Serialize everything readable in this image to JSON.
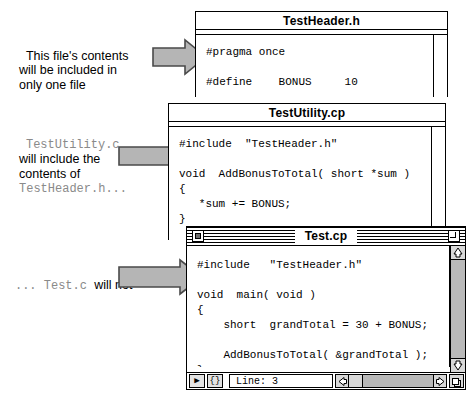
{
  "annotations": [
    {
      "id": "annot-1",
      "segments": [
        {
          "text": "This file's contents\nwill be included in\nonly one file",
          "style": "plain"
        }
      ],
      "arrow_name": "arrow-to-testheader"
    },
    {
      "id": "annot-2",
      "segments": [
        {
          "text": "TestUtility.c",
          "style": "mono"
        },
        {
          "text": "\nwill include the\ncontents of\n",
          "style": "plain"
        },
        {
          "text": "TestHeader.h...",
          "style": "mono"
        }
      ],
      "arrow_name": "arrow-to-testutility"
    },
    {
      "id": "annot-3",
      "segments": [
        {
          "text": "... Test.c ",
          "style": "mono"
        },
        {
          "text": "will not",
          "style": "plain"
        }
      ],
      "arrow_name": "arrow-to-test"
    }
  ],
  "windows": {
    "header": {
      "title": "TestHeader.h",
      "active": false,
      "code": "#pragma once\n\n#define    BONUS     10"
    },
    "utility": {
      "title": "TestUtility.cp",
      "active": false,
      "code": "#include  \"TestHeader.h\"\n\nvoid  AddBonusToTotal( short *sum )\n{\n   *sum += BONUS;\n}"
    },
    "test": {
      "title": "Test.cp",
      "active": true,
      "code": "#include   \"TestHeader.h\"\n\nvoid  main( void )\n{\n    short  grandTotal = 30 + BONUS;\n\n    AddBonusToTotal( &grandTotal );\n}",
      "status": {
        "popup_label": "▶",
        "braces_label": "{}",
        "line_label": "Line: 3"
      },
      "controls": {
        "close_box": "close-box",
        "zoom_box": "zoom-box",
        "scroll_up": "scroll-up-arrow",
        "scroll_down": "scroll-down-arrow",
        "scroll_left": "scroll-left-arrow",
        "scroll_right": "scroll-right-arrow",
        "grow_box": "grow-box"
      }
    }
  },
  "colors": {
    "ink": "#000000",
    "paper": "#ffffff",
    "arrow_fill": "#b5b5b5",
    "arrow_stroke": "#4a4a4a",
    "mono_text": "#8a8a8a",
    "scroll_track": "#b9b9b9",
    "scroll_thumb": "#d8d8d8"
  }
}
